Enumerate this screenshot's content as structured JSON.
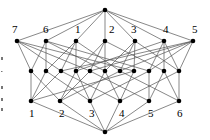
{
  "diagram": {
    "type": "hasse-diagram",
    "colors": {
      "edge": "#555555",
      "node": "#000000",
      "label": "#000000"
    },
    "nodes": [
      {
        "id": "top",
        "x": 105,
        "y": 10
      },
      {
        "id": "c7",
        "x": 17,
        "y": 41,
        "label": "7",
        "lx": 12,
        "ly": 33
      },
      {
        "id": "c6",
        "x": 46,
        "y": 41,
        "label": "6",
        "lx": 43,
        "ly": 33
      },
      {
        "id": "c1",
        "x": 76,
        "y": 41,
        "label": "1",
        "lx": 75,
        "ly": 33
      },
      {
        "id": "c2",
        "x": 105,
        "y": 41,
        "label": "2",
        "lx": 109,
        "ly": 33
      },
      {
        "id": "c3",
        "x": 135,
        "y": 41,
        "label": "3",
        "lx": 131,
        "ly": 33
      },
      {
        "id": "c4",
        "x": 164,
        "y": 41,
        "label": "4",
        "lx": 163,
        "ly": 33
      },
      {
        "id": "c5",
        "x": 193,
        "y": 41,
        "label": "5",
        "lx": 192,
        "ly": 33
      },
      {
        "id": "m1",
        "x": 31,
        "y": 71
      },
      {
        "id": "m2",
        "x": 46,
        "y": 71
      },
      {
        "id": "m3",
        "x": 61,
        "y": 71
      },
      {
        "id": "m4",
        "x": 76,
        "y": 71
      },
      {
        "id": "m5",
        "x": 90,
        "y": 71
      },
      {
        "id": "m6",
        "x": 105,
        "y": 71
      },
      {
        "id": "m7",
        "x": 120,
        "y": 71
      },
      {
        "id": "m8",
        "x": 134,
        "y": 71
      },
      {
        "id": "m9",
        "x": 149,
        "y": 71
      },
      {
        "id": "m10",
        "x": 164,
        "y": 71
      },
      {
        "id": "m11",
        "x": 179,
        "y": 71
      },
      {
        "id": "a1",
        "x": 31,
        "y": 101,
        "label": "1",
        "lx": 29,
        "ly": 117
      },
      {
        "id": "a2",
        "x": 60,
        "y": 101,
        "label": "2",
        "lx": 59,
        "ly": 117
      },
      {
        "id": "a3",
        "x": 90,
        "y": 101,
        "label": "3",
        "lx": 89,
        "ly": 117
      },
      {
        "id": "a4",
        "x": 120,
        "y": 101,
        "label": "4",
        "lx": 119,
        "ly": 117
      },
      {
        "id": "a5",
        "x": 149,
        "y": 101,
        "label": "5",
        "lx": 148,
        "ly": 117
      },
      {
        "id": "a6",
        "x": 179,
        "y": 101,
        "label": "6",
        "lx": 177,
        "ly": 117
      },
      {
        "id": "bottom",
        "x": 105,
        "y": 132
      }
    ],
    "edges": [
      [
        "top",
        "c7"
      ],
      [
        "top",
        "c6"
      ],
      [
        "top",
        "c1"
      ],
      [
        "top",
        "c2"
      ],
      [
        "top",
        "c3"
      ],
      [
        "top",
        "c4"
      ],
      [
        "top",
        "c5"
      ],
      [
        "c7",
        "m1"
      ],
      [
        "c7",
        "m3"
      ],
      [
        "c7",
        "m5"
      ],
      [
        "c7",
        "m8"
      ],
      [
        "c6",
        "m2"
      ],
      [
        "c6",
        "m1"
      ],
      [
        "c6",
        "m6"
      ],
      [
        "c6",
        "m9"
      ],
      [
        "c1",
        "m3"
      ],
      [
        "c1",
        "m4"
      ],
      [
        "c1",
        "m2"
      ],
      [
        "c1",
        "m7"
      ],
      [
        "c2",
        "m5"
      ],
      [
        "c2",
        "m6"
      ],
      [
        "c2",
        "m4"
      ],
      [
        "c2",
        "m10"
      ],
      [
        "c3",
        "m7"
      ],
      [
        "c3",
        "m8"
      ],
      [
        "c3",
        "m11"
      ],
      [
        "c3",
        "m6"
      ],
      [
        "c4",
        "m10"
      ],
      [
        "c4",
        "m9"
      ],
      [
        "c4",
        "m4"
      ],
      [
        "c4",
        "m11"
      ],
      [
        "c5",
        "m11"
      ],
      [
        "c5",
        "m9"
      ],
      [
        "c5",
        "m7"
      ],
      [
        "c5",
        "m5"
      ],
      [
        "c5",
        "m3"
      ],
      [
        "m1",
        "a1"
      ],
      [
        "m1",
        "a2"
      ],
      [
        "m2",
        "a1"
      ],
      [
        "m2",
        "a3"
      ],
      [
        "m3",
        "a1"
      ],
      [
        "m3",
        "a4"
      ],
      [
        "m4",
        "a2"
      ],
      [
        "m4",
        "a3"
      ],
      [
        "m5",
        "a2"
      ],
      [
        "m5",
        "a5"
      ],
      [
        "m6",
        "a3"
      ],
      [
        "m6",
        "a4"
      ],
      [
        "m7",
        "a2"
      ],
      [
        "m7",
        "a6"
      ],
      [
        "m8",
        "a4"
      ],
      [
        "m8",
        "a1"
      ],
      [
        "m9",
        "a5"
      ],
      [
        "m9",
        "a3"
      ],
      [
        "m10",
        "a5"
      ],
      [
        "m10",
        "a6"
      ],
      [
        "m11",
        "a6"
      ],
      [
        "m11",
        "a4"
      ],
      [
        "a1",
        "bottom"
      ],
      [
        "a2",
        "bottom"
      ],
      [
        "a3",
        "bottom"
      ],
      [
        "a4",
        "bottom"
      ],
      [
        "a5",
        "bottom"
      ],
      [
        "a6",
        "bottom"
      ]
    ],
    "top_labels": [
      "7",
      "6",
      "1",
      "2",
      "3",
      "4",
      "5"
    ],
    "bottom_labels": [
      "1",
      "2",
      "3",
      "4",
      "5",
      "6"
    ]
  }
}
